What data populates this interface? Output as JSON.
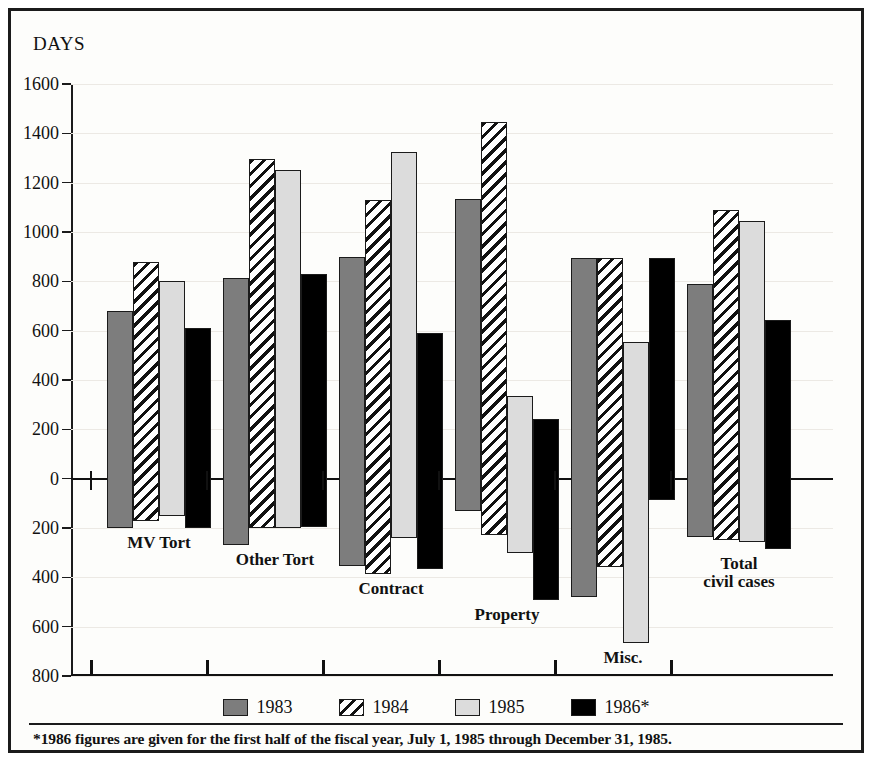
{
  "axis_title": "DAYS",
  "legend": [
    {
      "label": "1983",
      "style": "solid-gray",
      "color": "#7d7d7d"
    },
    {
      "label": "1984",
      "style": "diagonal-hatch",
      "color": "#ffffff"
    },
    {
      "label": "1985",
      "style": "solid-light-gray",
      "color": "#dcdcdc"
    },
    {
      "label": "1986*",
      "style": "solid-black",
      "color": "#000000"
    }
  ],
  "footnote": "*1986 figures are given for the first half of the fiscal year, July 1, 1985 through December 31, 1985.",
  "chart_data": {
    "type": "bar",
    "title": "",
    "subtitle": "",
    "xlabel": "",
    "ylabel": "DAYS",
    "grid": true,
    "legend_position": "bottom",
    "orientation": "vertical-bidirectional",
    "note": "Bars extend both above and below the zero line; the axis is labeled with positive magnitudes in both directions.",
    "ylim": [
      -800,
      1600
    ],
    "yticks_above": [
      0,
      200,
      400,
      600,
      800,
      1000,
      1200,
      1400,
      1600
    ],
    "yticks_below": [
      200,
      400,
      600,
      800
    ],
    "ytick_labels": [
      "1600",
      "1400",
      "1200",
      "1000",
      "800",
      "600",
      "400",
      "200",
      "0",
      "200",
      "400",
      "600",
      "800"
    ],
    "categories": [
      "MV Tort",
      "Other Tort",
      "Contract",
      "Property",
      "Misc.",
      "Total civil cases"
    ],
    "series": [
      {
        "name": "1983",
        "values_above": [
          680,
          815,
          900,
          1135,
          895,
          790
        ],
        "values_below": [
          200,
          270,
          355,
          130,
          480,
          235
        ]
      },
      {
        "name": "1984",
        "values_above": [
          880,
          1295,
          1130,
          1445,
          895,
          1090
        ],
        "values_below": [
          170,
          200,
          385,
          230,
          360,
          250
        ]
      },
      {
        "name": "1985",
        "values_above": [
          800,
          1250,
          1325,
          335,
          555,
          1045
        ],
        "values_below": [
          150,
          200,
          240,
          300,
          665,
          255
        ]
      },
      {
        "name": "1986*",
        "values_above": [
          610,
          830,
          590,
          240,
          895,
          645
        ],
        "values_below": [
          200,
          195,
          365,
          490,
          85,
          285
        ]
      }
    ]
  }
}
